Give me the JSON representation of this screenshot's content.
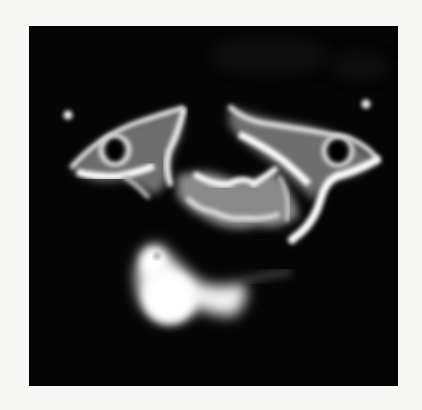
{
  "image": {
    "kind": "grayscale axial scan (CT-like)",
    "background_color": "#f7f7f5",
    "frame_color": "#050505",
    "bone_color": "#ffffff",
    "soft_tissue_color": "#9a9a9a",
    "frame": {
      "x": 29,
      "y": 26,
      "width": 369,
      "height": 360
    }
  }
}
